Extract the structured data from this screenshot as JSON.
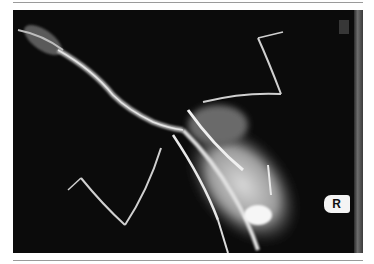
{
  "figure": {
    "type": "radiograph",
    "marker_label": "R",
    "colors": {
      "background": "#0b0b0b",
      "bone": "#e8e8e8",
      "soft_tissue": "#8a8a8a",
      "frame_rule": "#9a9a9a"
    }
  }
}
